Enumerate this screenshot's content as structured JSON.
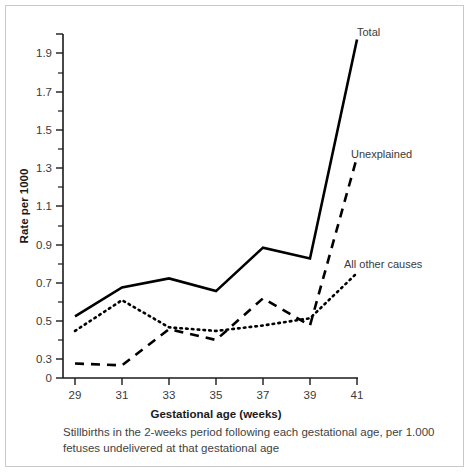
{
  "chart_data": {
    "type": "line",
    "title": "",
    "xlabel": "Gestational age (weeks)",
    "ylabel": "Rate per 1000",
    "x": [
      29,
      31,
      33,
      35,
      37,
      39,
      41
    ],
    "xlim": [
      29,
      41
    ],
    "ylim": [
      0,
      1.9
    ],
    "xticks": [
      29,
      31,
      33,
      35,
      37,
      39,
      41
    ],
    "xticklabels": [
      "29",
      "31",
      "33",
      "35",
      "37",
      "39",
      "41"
    ],
    "xminorticks": [
      30,
      32,
      34,
      36,
      38,
      40
    ],
    "yticks": [
      0,
      0.1,
      0.3,
      0.5,
      0.7,
      0.9,
      1.1,
      1.3,
      1.5,
      1.7,
      1.9
    ],
    "yticklabels": [
      "0",
      "0.1",
      "0.3",
      "0.5",
      "0.7",
      "0.9",
      "1.1",
      "1.3",
      "1.5",
      "1.7",
      "1.9"
    ],
    "yminorticks": [
      0.2,
      0.4,
      0.6,
      0.8,
      1.0,
      1.2,
      1.4,
      1.6,
      1.8
    ],
    "grid": false,
    "legend_position": "line-end-labels",
    "series": [
      {
        "name": "Total",
        "style": "solid",
        "color": "#000000",
        "values": [
          0.34,
          0.5,
          0.55,
          0.48,
          0.72,
          0.66,
          1.87
        ]
      },
      {
        "name": "Unexplained",
        "style": "dashed",
        "color": "#000000",
        "values": [
          0.08,
          0.07,
          0.27,
          0.21,
          0.44,
          0.29,
          1.22
        ]
      },
      {
        "name": "All other causes",
        "style": "dotted",
        "color": "#000000",
        "values": [
          0.26,
          0.43,
          0.28,
          0.26,
          0.29,
          0.33,
          0.58
        ]
      }
    ]
  },
  "series_labels": {
    "total": "Total",
    "unexplained": "Unexplained",
    "all_other_causes": "All other causes"
  },
  "axis": {
    "x_title": "Gestational age (weeks)",
    "y_title": "Rate per 1000"
  },
  "caption": {
    "line1": "Stillbirths in the 2-weeks period following each gestational age, per",
    "line2": "1.000 fetuses undelivered at that gestational age"
  },
  "colors": {
    "ink": "#000000",
    "text": "#3a3a3a",
    "frame": "#c9c9c9",
    "background": "#ffffff"
  }
}
